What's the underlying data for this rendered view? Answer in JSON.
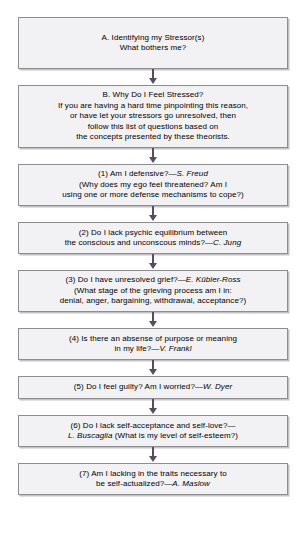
{
  "chart_data": {
    "type": "diagram",
    "orientation": "vertical",
    "node_count": 9,
    "connector_count": 8
  },
  "theme": {
    "node_fill": "#f2f2f4",
    "node_border": "#8e8e92",
    "arrow_color": "#5a4a63",
    "text_color": "#000000",
    "background": "#ffffff"
  },
  "nodes": [
    {
      "id": "a",
      "lines": [
        "A. Identifying my Stressor(s)",
        "What bothers me?"
      ]
    },
    {
      "id": "b",
      "lines": [
        "B. Why Do I Feel Stressed?",
        "If you are having a hard time pinpointing this reason,",
        "or have let your stressors go unresolved, then",
        "follow this list of questions based on",
        "the concepts presented by these theorists."
      ]
    },
    {
      "id": "q1",
      "line1_pre": "(1) Am I defensive?—",
      "line1_attrib": "S. Freud",
      "lines": [
        "(Why does my ego feel threatened? Am I",
        "using one or more defense mechanisms to cope?)"
      ]
    },
    {
      "id": "q2",
      "lines": [
        "(2) Do I lack psychic equilibrium between"
      ],
      "line2_pre": "the conscious and unconscous minds?—",
      "line2_attrib": "C. Jung"
    },
    {
      "id": "q3",
      "line1_pre": "(3) Do I have unresolved grief?—",
      "line1_attrib": "E. Kübler-Ross",
      "lines": [
        "(What stage of the grieving process am I in:",
        "denial, anger, bargaining, withdrawal, acceptance?)"
      ]
    },
    {
      "id": "q4",
      "lines": [
        "(4) Is there an absense of purpose or meaning"
      ],
      "line2_pre": "in my life?—",
      "line2_attrib": "V. Frankl"
    },
    {
      "id": "q5",
      "line1_pre": "(5) Do I feel guilty? Am I worried?—",
      "line1_attrib": "W. Dyer"
    },
    {
      "id": "q6",
      "lines": [
        "(6) Do I lack self-acceptance and self-love?—"
      ],
      "line2_attrib": "L. Buscaglia",
      "line2_post": " (What is my level of self-esteem?)"
    },
    {
      "id": "q7",
      "lines": [
        "(7) Am I lacking in the traits necessary to"
      ],
      "line2_pre": "be self-actualized?—",
      "line2_attrib": "A. Maslow"
    }
  ]
}
